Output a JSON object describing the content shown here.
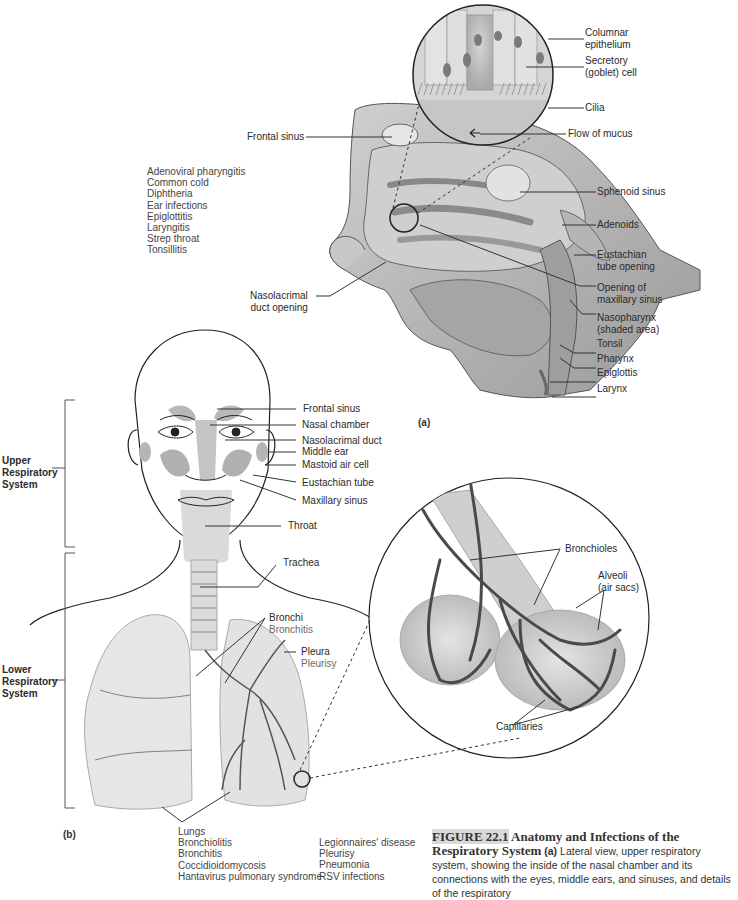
{
  "panel_a": {
    "tag": "(a)",
    "inset_labels": [
      {
        "text": "Columnar",
        "text2": "epithelium"
      },
      {
        "text": "Secretory",
        "text2": "(goblet) cell"
      },
      {
        "text": "Cilia"
      },
      {
        "text": "Flow of mucus"
      }
    ],
    "left_labels": {
      "frontal_sinus": "Frontal sinus",
      "nasolacrimal": "Nasolacrimal",
      "nasolacrimal2": "duct opening"
    },
    "right_labels": {
      "sphenoid": "Sphenoid sinus",
      "adenoids": "Adenoids",
      "eustachian1": "Eustachian",
      "eustachian2": "tube opening",
      "maxillary1": "Opening of",
      "maxillary2": "maxillary sinus",
      "naso1": "Nasopharynx",
      "naso2": "(shaded area)",
      "tonsil": "Tonsil",
      "pharynx": "Pharynx",
      "epiglottis": "Epiglottis",
      "larynx": "Larynx"
    },
    "upper_infections": [
      "Adenoviral pharyngitis",
      "Common cold",
      "Diphtheria",
      "Ear infections",
      "Epiglottitis",
      "Laryngitis",
      "Strep throat",
      "Tonsillitis"
    ]
  },
  "panel_b": {
    "tag": "(b)",
    "upper_system": [
      "Upper",
      "Respiratory",
      "System"
    ],
    "lower_system": [
      "Lower",
      "Respiratory",
      "System"
    ],
    "face_labels": {
      "frontal_sinus": "Frontal sinus",
      "nasal_chamber": "Nasal chamber",
      "nasolacrimal_duct": "Nasolacrimal duct",
      "middle_ear": "Middle ear",
      "mastoid": "Mastoid air cell",
      "eustachian": "Eustachian tube",
      "maxillary": "Maxillary sinus",
      "throat": "Throat",
      "trachea": "Trachea"
    },
    "lung_labels": {
      "bronchi": "Bronchi",
      "bronchitis": "Bronchitis",
      "pleura": "Pleura",
      "pleurisy": "Pleurisy"
    },
    "alveoli_labels": {
      "bronchioles": "Bronchioles",
      "alveoli1": "Alveoli",
      "alveoli2": "(air sacs)",
      "capillaries": "Capillaries"
    },
    "lungs_heading": "Lungs",
    "lower_infections_col1": [
      "Bronchiolitis",
      "Bronchitis",
      "Coccidioidomycosis",
      "Hantavirus pulmonary syndrome"
    ],
    "lower_infections_col2": [
      "Legionnaires' disease",
      "Pleurisy",
      "Pneumonia",
      "RSV infections"
    ]
  },
  "caption": {
    "figure_no": "FIGURE 22.1",
    "title": " Anatomy and Infections of the Respiratory System",
    "part_a": "(a)",
    "body": " Lateral view, upper respiratory system, showing the inside of the nasal chamber and its connections with the eyes, middle ears, and sinuses, and details of the respiratory"
  },
  "colors": {
    "line": "#3a3a3a",
    "tissue": "#bdbdbd",
    "tissue_light": "#dcdcdc",
    "sinus": "#a8a8a8",
    "caption_highlight": "#d9d9d9"
  }
}
